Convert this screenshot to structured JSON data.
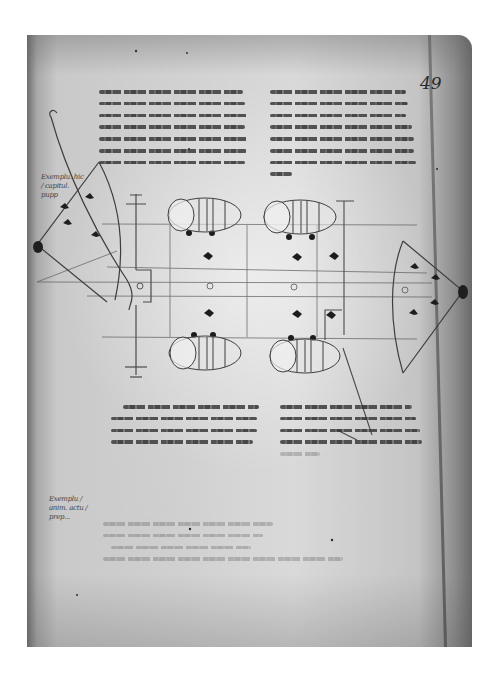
{
  "document": {
    "type": "manuscript-folio",
    "folio_number": "49",
    "colors": {
      "background": "#ffffff",
      "parchment": "#d4d4d4",
      "ink": "#2e2e2e",
      "edge_shadow": "#6a6a6a"
    },
    "upper_text": {
      "left_column": {
        "line_count": 7,
        "lines": [
          "[illegible script line 1]",
          "[illegible script line 2]",
          "[illegible script line 3]",
          "[illegible script line 4]",
          "[illegible script line 5]",
          "[illegible script line 6]",
          "[illegible script line 7]"
        ]
      },
      "right_column": {
        "line_count": 8,
        "lines": [
          "[illegible script line 1]",
          "[illegible script line 2]",
          "[illegible script line 3]",
          "[illegible script line 4]",
          "[illegible script line 5]",
          "[illegible script line 6]",
          "[illegible script line 7]",
          "[illegible script line 8]"
        ]
      }
    },
    "margin_notes": [
      {
        "position": "left-upper",
        "text": "Exemplu. hic / capitul. pupp"
      },
      {
        "position": "left-lower",
        "text": "Exemplu / anim. actu / prep..."
      }
    ],
    "diagram": {
      "subject": "ship plan with barrels (top view)",
      "barrels": [
        {
          "position": "top-left"
        },
        {
          "position": "top-right"
        },
        {
          "position": "bottom-left"
        },
        {
          "position": "bottom-right"
        }
      ],
      "anchors_crosses": 3,
      "bow_left": "curved prow with fan shape",
      "bow_right": "curved stern with fan shape"
    },
    "lower_text": {
      "left_column": {
        "line_count": 4
      },
      "right_column": {
        "line_count": 5
      }
    },
    "faint_text_block": {
      "line_count": 4
    }
  }
}
